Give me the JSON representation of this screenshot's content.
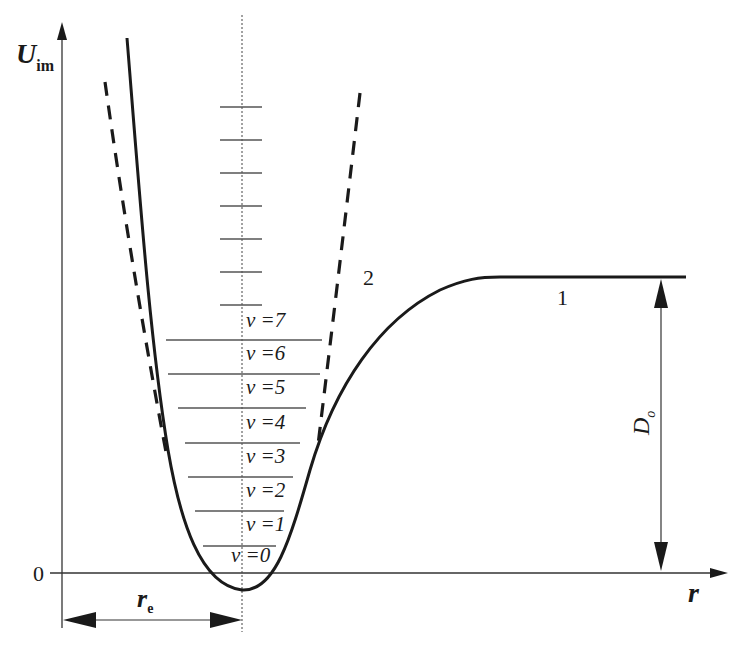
{
  "diagram": {
    "y_axis": {
      "symbol": "U",
      "subscript": "im"
    },
    "x_axis": {
      "symbol": "r"
    },
    "origin_label": "0",
    "equilibrium_distance": {
      "symbol": "r",
      "subscript": "e"
    },
    "dissociation_energy": {
      "symbol": "D",
      "subscript": "o"
    },
    "curves": [
      {
        "id": "1",
        "label": "1",
        "style": "solid",
        "description": "anharmonic (Morse-like) potential"
      },
      {
        "id": "2",
        "label": "2",
        "style": "dashed",
        "description": "harmonic (parabolic) approximation"
      }
    ],
    "vibrational_levels": [
      {
        "v": 0,
        "label": "v =0"
      },
      {
        "v": 1,
        "label": "v =1"
      },
      {
        "v": 2,
        "label": "v =2"
      },
      {
        "v": 3,
        "label": "v =3"
      },
      {
        "v": 4,
        "label": "v =4"
      },
      {
        "v": 5,
        "label": "v =5"
      },
      {
        "v": 6,
        "label": "v =6"
      },
      {
        "v": 7,
        "label": "v =7"
      }
    ],
    "harmonic_level_ticks": 7,
    "colors": {
      "ink": "#1a1a1a",
      "thin": "#555555",
      "background": "#ffffff"
    }
  }
}
